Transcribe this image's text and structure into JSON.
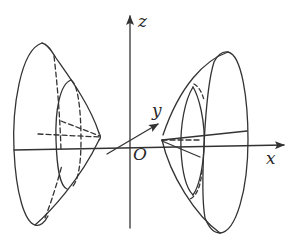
{
  "figure": {
    "line_color": "#333333",
    "background": "#ffffff"
  },
  "axes": {
    "z_label": "z",
    "y_label": "y",
    "x_label": "x",
    "origin_label": "O"
  }
}
